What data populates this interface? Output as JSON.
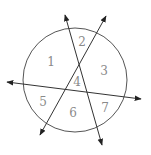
{
  "diagram": {
    "regions": [
      "1",
      "2",
      "3",
      "4",
      "5",
      "6",
      "7"
    ],
    "colors": {
      "circle": "#555555",
      "lines": "#333333",
      "labels": "#8a8a8a"
    }
  }
}
